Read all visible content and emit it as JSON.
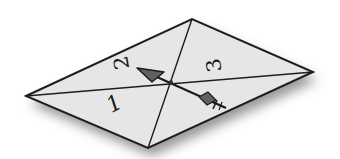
{
  "diagram": {
    "type": "perspective-parallelogram",
    "shape": {
      "corners": {
        "left": [
          26,
          96
        ],
        "top": [
          192,
          19
        ],
        "right": [
          313,
          72
        ],
        "bottom": [
          148,
          148
        ]
      },
      "fill": "#e4e4e4",
      "stroke": "#1e1e1e",
      "shadow": "#6a6a6a"
    },
    "diagonals": [
      {
        "from": "left",
        "to": "right"
      },
      {
        "from": "top",
        "to": "bottom"
      }
    ],
    "labels": [
      {
        "text": "1",
        "region": "left-bottom"
      },
      {
        "text": "2",
        "region": "left-top"
      },
      {
        "text": "3",
        "region": "right-top"
      }
    ],
    "arrow": {
      "from": [
        226,
        108
      ],
      "to": [
        137,
        69
      ],
      "head_color": "#555555",
      "description": "arrow pointing toward region 2, tail toward bottom-right"
    }
  }
}
